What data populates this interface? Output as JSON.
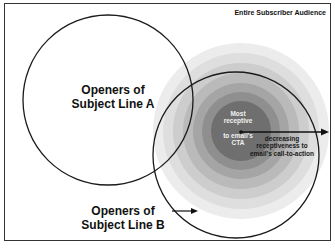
{
  "diagram": {
    "type": "venn-with-gradient",
    "frame_label": "Entire Subscriber Audience",
    "circle_a": {
      "label_line1": "Openers of",
      "label_line2": "Subject Line A"
    },
    "circle_b": {
      "label_line1": "Openers of",
      "label_line2": "Subject Line B"
    },
    "center": {
      "line1": "Most",
      "line2": "receptive",
      "line3": "to email's",
      "line4": "CTA"
    },
    "gradient_arrow": {
      "line1": "decreasing",
      "line2": "receptiveness to",
      "line3": "email's call-to-action"
    },
    "ring_colors": [
      "#ebebeb",
      "#dcdcdc",
      "#cbcbcb",
      "#b8b8b8",
      "#a3a3a3",
      "#8e8e8e",
      "#747474",
      "#5c5c5c"
    ],
    "line_color": "#1a1a1a"
  }
}
